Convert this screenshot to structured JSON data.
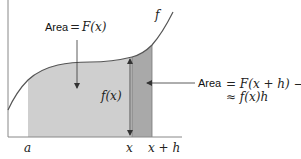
{
  "diagram": {
    "type": "area-under-curve",
    "function_label": "f",
    "labels": {
      "area_top": {
        "word": "Area",
        "equals": "=",
        "expr": "F(x)"
      },
      "area_right": {
        "word": "Area",
        "line1": "= F(x + h) − F(x)",
        "line2": "≈ f(x)h"
      },
      "height": "f(x)"
    },
    "x_axis_ticks": [
      "a",
      "x",
      "x + h"
    ],
    "colors": {
      "curve": "#555555",
      "axis": "#888888",
      "region_light": "#cfcfcf",
      "region_dark": "#a9a9a9",
      "arrow": "#333333",
      "background": "#ffffff"
    }
  }
}
